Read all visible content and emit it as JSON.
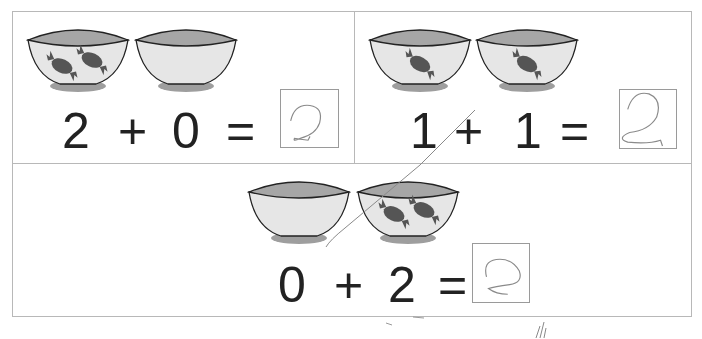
{
  "worksheet": {
    "problems": [
      {
        "id": "p1",
        "bowls": [
          {
            "candies": 2
          },
          {
            "candies": 0
          }
        ],
        "left": "2",
        "op": "+",
        "right": "0",
        "equals": "=",
        "answer_handwritten": "2"
      },
      {
        "id": "p2",
        "bowls": [
          {
            "candies": 1
          },
          {
            "candies": 1
          }
        ],
        "left": "1",
        "op": "+",
        "right": "1",
        "equals": "=",
        "answer_handwritten": "2"
      },
      {
        "id": "p3",
        "bowls": [
          {
            "candies": 0
          },
          {
            "candies": 2
          }
        ],
        "left": "0",
        "op": "+",
        "right": "2",
        "equals": "=",
        "answer_handwritten": "2"
      }
    ]
  },
  "colors": {
    "border": "#b8b8b8",
    "bowl_rim": "#a6a6a6",
    "bowl_body": "#e6e6e6",
    "bowl_base": "#9e9e9e",
    "candy": "#555555",
    "text": "#222222",
    "pencil": "#8a8a8a"
  }
}
